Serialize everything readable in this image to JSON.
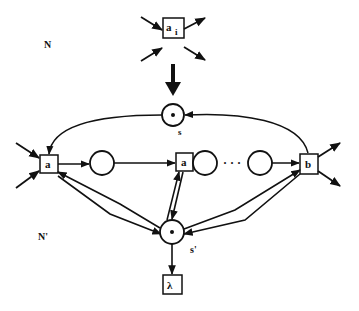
{
  "diagram": {
    "type": "petri-net-refinement",
    "colors": {
      "stroke": "#111111",
      "background": "#ffffff"
    },
    "labels": {
      "net_top": "N",
      "net_bottom": "N'",
      "place_s": "s",
      "place_s_prime": "s'"
    },
    "top_transition": {
      "label": "a",
      "subscript": "i"
    },
    "transitions": {
      "left": "a",
      "middle": "a",
      "right": "b",
      "bottom": "λ"
    },
    "chain": {
      "ellipsis": "· · ·",
      "places": 3
    },
    "places": {
      "s": {
        "tokens": 1
      },
      "s_prime": {
        "tokens": 1
      }
    },
    "refinement_arrow": "down"
  }
}
